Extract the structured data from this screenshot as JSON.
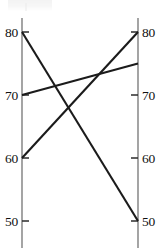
{
  "chart_data": {
    "type": "line",
    "title": "",
    "subtitle": "",
    "xlabel": "",
    "ylabel": "",
    "grid": false,
    "legend": "none",
    "axis_style": "parallel-coordinates-slope-chart",
    "x": [
      "left",
      "right"
    ],
    "categories": [
      "left",
      "right"
    ],
    "ylim": [
      47,
      82
    ],
    "left_axis": {
      "name": "left-axis",
      "tick_labels": [
        "80",
        "70",
        "60",
        "50"
      ],
      "tick_values": [
        80,
        70,
        60,
        50
      ]
    },
    "right_axis": {
      "name": "right-axis",
      "tick_labels": [
        "80",
        "70",
        "60",
        "50"
      ],
      "tick_values": [
        80,
        70,
        60,
        50
      ]
    },
    "series": [
      {
        "name": "line-1",
        "values": [
          80,
          50
        ]
      },
      {
        "name": "line-2",
        "values": [
          70,
          75
        ]
      },
      {
        "name": "line-3",
        "values": [
          60,
          80
        ]
      }
    ]
  },
  "geometry": {
    "left_axis_x": 22,
    "right_axis_x": 138,
    "axis_top_y": 18,
    "axis_bottom_y": 248,
    "value_top": 80,
    "value_top_y": 32,
    "value_bottom": 50,
    "value_bottom_y": 221,
    "tick_len_left": 7,
    "tick_len_right": 7
  },
  "colors": {
    "background": "#ffffff",
    "axis": "#8e8e8e",
    "tick": "#2b2b2b",
    "line": "#1b1b1b",
    "label": "#111111"
  }
}
